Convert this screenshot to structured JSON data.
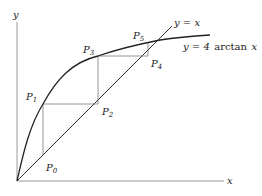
{
  "diagram": {
    "axes": {
      "x_label": "x",
      "y_label": "y"
    },
    "curves": {
      "identity_label": "y = x",
      "arctan_label_prefix": "y = 4",
      "arctan_label_func": "arctan",
      "arctan_label_var": "x"
    },
    "points": [
      {
        "name": "P",
        "sub": "0"
      },
      {
        "name": "P",
        "sub": "1"
      },
      {
        "name": "P",
        "sub": "2"
      },
      {
        "name": "P",
        "sub": "3"
      },
      {
        "name": "P",
        "sub": "4"
      },
      {
        "name": "P",
        "sub": "5"
      }
    ],
    "colors": {
      "curve": "#222222",
      "axes": "#9a9a9a",
      "cobweb": "#8a8a8a"
    }
  }
}
